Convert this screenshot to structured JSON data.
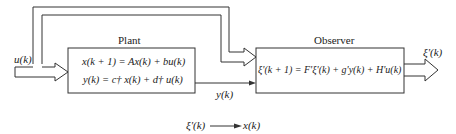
{
  "diagram": {
    "type": "block-diagram",
    "colors": {
      "stroke": "#333333",
      "text": "#222222",
      "background": "#ffffff"
    },
    "blocks": {
      "plant": {
        "title": "Plant",
        "equation_1": "x(k + 1) = Ax(k) + bu(k)",
        "equation_2": "y(k) = c† x(k) + d† u(k)"
      },
      "observer": {
        "title": "Observer",
        "equation": "ξ'(k + 1) = F'ξ'(k) + g'y(k) + H'u(k)"
      }
    },
    "signals": {
      "input": "u(k)",
      "plant_output": "y(k)",
      "observer_output": "ξ'(k)"
    },
    "relation": {
      "from": "ξ'(k)",
      "to": "x(k)"
    }
  }
}
